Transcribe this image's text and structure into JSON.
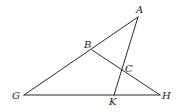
{
  "diagram": {
    "type": "geometry",
    "stroke_color": "#2a2a2a",
    "label_color": "#222222",
    "background": "#ffffff",
    "points": [
      {
        "name": "A",
        "x": 138,
        "y": 17,
        "label_x": 137,
        "label_y": 13
      },
      {
        "name": "B",
        "x": 92,
        "y": 50,
        "label_x": 84,
        "label_y": 48
      },
      {
        "name": "C",
        "x": 122,
        "y": 70,
        "label_x": 125,
        "label_y": 72
      },
      {
        "name": "G",
        "x": 24,
        "y": 95,
        "label_x": 12,
        "label_y": 99
      },
      {
        "name": "H",
        "x": 160,
        "y": 95,
        "label_x": 162,
        "label_y": 99
      },
      {
        "name": "K",
        "x": 114,
        "y": 95,
        "label_x": 108,
        "label_y": 104
      }
    ],
    "segments": [
      {
        "from": "G",
        "to": "A"
      },
      {
        "from": "G",
        "to": "H"
      },
      {
        "from": "B",
        "to": "H"
      },
      {
        "from": "A",
        "to": "K"
      }
    ],
    "labels": {
      "A": "A",
      "B": "B",
      "C": "C",
      "G": "G",
      "H": "H",
      "K": "K"
    }
  }
}
